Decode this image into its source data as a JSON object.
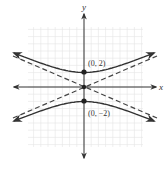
{
  "diagram": {
    "type": "hyperbola-graph",
    "equation_form": "y^2/4 - x^2/b^2 = 1",
    "axes": {
      "x_label": "x",
      "y_label": "y"
    },
    "points": [
      {
        "label": "(0, 2)",
        "x": 0,
        "y": 2
      },
      {
        "label": "(0, −2)",
        "x": 0,
        "y": -2
      }
    ],
    "asymptotes": {
      "style": "dashed",
      "slope": 0.44
    },
    "colors": {
      "curve": "#333333",
      "grid": "#e2e2e2",
      "axis": "#333333"
    }
  }
}
